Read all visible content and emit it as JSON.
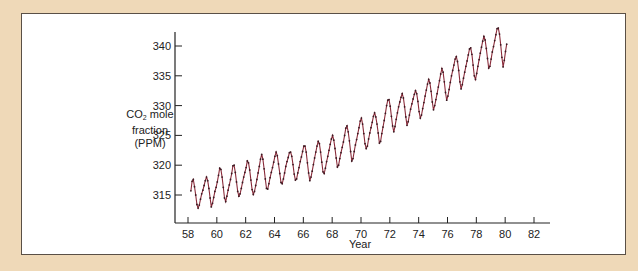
{
  "chart_data": {
    "type": "line",
    "title": "",
    "xlabel": "Year",
    "ylabel": "CO2 mole fraction (PPM)",
    "ylabel_parts": {
      "pre": "CO",
      "sub": "2",
      "post": " mole",
      "line2": "fraction",
      "line3": "(PPM)"
    },
    "xlim": [
      57.5,
      83
    ],
    "ylim": [
      310.3,
      343.8
    ],
    "x_ticks": [
      58,
      60,
      62,
      64,
      66,
      68,
      70,
      72,
      74,
      76,
      78,
      80,
      82
    ],
    "y_ticks": [
      315,
      320,
      325,
      330,
      335,
      340
    ],
    "grid": false,
    "legend": null,
    "line_color": "#8a2b3a",
    "marker_color": "#3a1a22",
    "series": [
      {
        "name": "CO2 (monthly, Mauna Loa)",
        "x_start": 58.2,
        "x_step": 0.0833,
        "values": [
          315.7,
          317.3,
          317.6,
          316.4,
          315.0,
          313.4,
          312.8,
          313.3,
          314.3,
          315.2,
          315.8,
          316.6,
          317.4,
          318.0,
          317.4,
          316.1,
          314.5,
          313.0,
          313.6,
          314.6,
          315.6,
          316.3,
          317.2,
          318.3,
          319.5,
          319.3,
          318.0,
          316.3,
          314.5,
          313.9,
          314.8,
          315.8,
          316.7,
          317.6,
          318.6,
          319.9,
          320.0,
          318.8,
          317.2,
          315.6,
          314.8,
          315.2,
          316.1,
          317.1,
          318.0,
          318.8,
          319.6,
          320.7,
          320.4,
          319.2,
          317.5,
          315.9,
          315.1,
          315.6,
          316.6,
          317.6,
          318.7,
          319.8,
          321.0,
          321.8,
          321.0,
          319.4,
          317.7,
          316.1,
          316.0,
          316.9,
          317.9,
          318.8,
          319.6,
          320.5,
          321.5,
          322.2,
          321.6,
          320.2,
          318.6,
          317.1,
          316.9,
          317.7,
          318.7,
          319.8,
          320.6,
          321.3,
          322.1,
          322.2,
          321.5,
          320.1,
          318.5,
          317.5,
          317.7,
          318.7,
          319.6,
          320.6,
          321.4,
          322.3,
          323.2,
          323.2,
          322.2,
          320.4,
          318.7,
          317.4,
          318.0,
          319.0,
          320.1,
          321.2,
          322.2,
          323.2,
          324.0,
          323.6,
          322.2,
          320.5,
          318.9,
          318.6,
          319.5,
          320.6,
          321.5,
          322.5,
          323.5,
          324.4,
          325.0,
          324.2,
          322.8,
          321.2,
          319.7,
          320.0,
          321.1,
          322.1,
          323.0,
          323.9,
          325.0,
          326.2,
          326.6,
          325.6,
          324.1,
          322.3,
          320.7,
          321.1,
          322.3,
          323.4,
          324.3,
          325.3,
          326.3,
          327.4,
          327.9,
          326.9,
          325.3,
          323.6,
          322.8,
          323.2,
          324.4,
          325.4,
          326.3,
          327.2,
          328.2,
          328.8,
          328.1,
          326.9,
          325.4,
          323.7,
          324.0,
          325.3,
          326.4,
          327.5,
          328.7,
          330.0,
          330.9,
          331.0,
          329.9,
          328.2,
          326.6,
          325.6,
          326.5,
          327.7,
          328.8,
          329.8,
          330.6,
          331.4,
          332.0,
          331.3,
          329.8,
          328.1,
          326.7,
          327.3,
          328.4,
          329.4,
          330.3,
          331.1,
          331.9,
          332.5,
          332.0,
          330.7,
          329.0,
          327.9,
          328.4,
          329.5,
          330.5,
          331.6,
          332.6,
          333.6,
          334.4,
          333.8,
          332.4,
          330.6,
          329.3,
          330.0,
          331.0,
          332.0,
          333.1,
          334.2,
          335.3,
          336.2,
          335.6,
          334.0,
          332.2,
          330.9,
          331.6,
          332.7,
          333.9,
          335.0,
          335.9,
          336.8,
          337.8,
          338.2,
          337.4,
          335.9,
          334.0,
          332.8,
          333.5,
          334.6,
          335.6,
          336.6,
          337.5,
          338.5,
          339.5,
          339.7,
          338.6,
          336.8,
          335.0,
          334.4,
          335.4,
          336.6,
          337.7,
          338.8,
          339.8,
          340.8,
          341.6,
          341.0,
          339.6,
          337.9,
          336.3,
          336.6,
          337.8,
          339.0,
          339.9,
          340.9,
          341.9,
          342.9,
          343.0,
          342.0,
          340.2,
          338.1,
          336.5,
          337.6,
          339.1,
          340.3
        ]
      }
    ]
  }
}
